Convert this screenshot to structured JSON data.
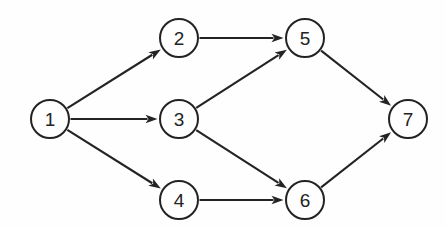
{
  "diagram": {
    "type": "directed-graph",
    "background_color": "#fefefe",
    "stroke_color": "#232323",
    "node_radius": 19,
    "nodes": [
      {
        "id": "1",
        "label": "1",
        "cx": 50,
        "cy": 119
      },
      {
        "id": "2",
        "label": "2",
        "cx": 179,
        "cy": 38
      },
      {
        "id": "3",
        "label": "3",
        "cx": 179,
        "cy": 119
      },
      {
        "id": "4",
        "label": "4",
        "cx": 179,
        "cy": 200
      },
      {
        "id": "5",
        "label": "5",
        "cx": 305,
        "cy": 38
      },
      {
        "id": "6",
        "label": "6",
        "cx": 305,
        "cy": 200
      },
      {
        "id": "7",
        "label": "7",
        "cx": 408,
        "cy": 119
      }
    ],
    "edges": [
      {
        "id": "e1-2",
        "from": "1",
        "to": "2",
        "directed": true
      },
      {
        "id": "e1-3",
        "from": "1",
        "to": "3",
        "directed": true
      },
      {
        "id": "e1-4",
        "from": "1",
        "to": "4",
        "directed": true
      },
      {
        "id": "e2-5",
        "from": "2",
        "to": "5",
        "directed": true
      },
      {
        "id": "e3-5",
        "from": "3",
        "to": "5",
        "directed": true
      },
      {
        "id": "e3-6",
        "from": "3",
        "to": "6",
        "directed": true
      },
      {
        "id": "e4-6",
        "from": "4",
        "to": "6",
        "directed": true
      },
      {
        "id": "e5-7",
        "from": "5",
        "to": "7",
        "directed": true
      },
      {
        "id": "e6-7",
        "from": "6",
        "to": "7",
        "directed": true
      }
    ]
  }
}
